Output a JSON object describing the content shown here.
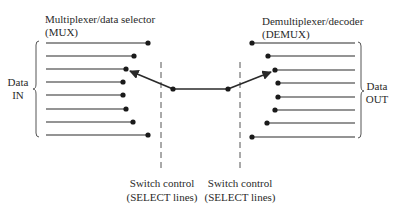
{
  "diagram": {
    "type": "mux-demux-switch",
    "mux": {
      "title_line1": "Multiplexer/data selector",
      "title_line2": "(MUX)",
      "group_label_line1": "Data",
      "group_label_line2": "IN",
      "inputs": [
        {
          "y": 43,
          "dot_x": 148
        },
        {
          "y": 56,
          "dot_x": 134
        },
        {
          "y": 69,
          "dot_x": 126
        },
        {
          "y": 82,
          "dot_x": 123
        },
        {
          "y": 95,
          "dot_x": 123
        },
        {
          "y": 109,
          "dot_x": 126
        },
        {
          "y": 122,
          "dot_x": 133
        },
        {
          "y": 135,
          "dot_x": 148
        }
      ],
      "selected_index": 2
    },
    "demux": {
      "title_line1": "Demultiplexer/decoder",
      "title_line2": "(DEMUX)",
      "group_label_line1": "Data",
      "group_label_line2": "OUT",
      "outputs": [
        {
          "y": 43,
          "dot_x": 252
        },
        {
          "y": 56,
          "dot_x": 268
        },
        {
          "y": 70,
          "dot_x": 275
        },
        {
          "y": 83,
          "dot_x": 278
        },
        {
          "y": 97,
          "dot_x": 278
        },
        {
          "y": 110,
          "dot_x": 275
        },
        {
          "y": 123,
          "dot_x": 267
        },
        {
          "y": 137,
          "dot_x": 252
        }
      ],
      "selected_index": 2
    },
    "switch_controls": [
      {
        "label_line1": "Switch control",
        "label_line2": "(SELECT lines)"
      },
      {
        "label_line1": "Switch control",
        "label_line2": "(SELECT lines)"
      }
    ],
    "colors": {
      "line": "#2a2a2a",
      "dashed": "#555555",
      "background": "#ffffff"
    }
  }
}
